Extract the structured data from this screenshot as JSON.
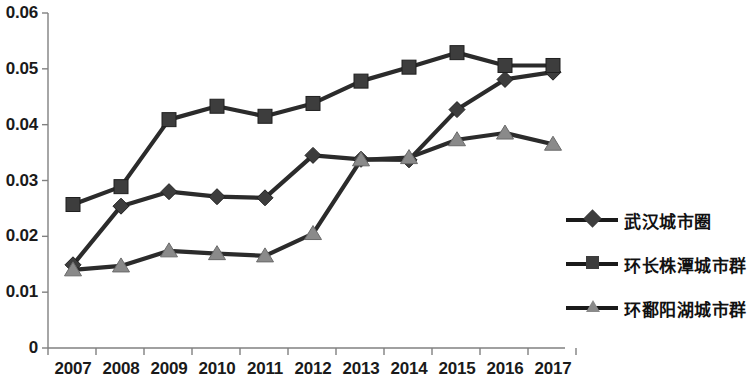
{
  "chart_data": {
    "type": "line",
    "title": "",
    "subtitle": "",
    "xlabel": "",
    "ylabel": "",
    "categories": [
      "2007",
      "2008",
      "2009",
      "2010",
      "2011",
      "2012",
      "2013",
      "2014",
      "2015",
      "2016",
      "2017"
    ],
    "ylim": [
      0,
      0.06
    ],
    "y_ticks": [
      "0",
      "0.01",
      "0.02",
      "0.03",
      "0.04",
      "0.05",
      "0.06"
    ],
    "y_tick_values": [
      0,
      0.01,
      0.02,
      0.03,
      0.04,
      0.05,
      0.06
    ],
    "grid": false,
    "legend_position": "right",
    "series": [
      {
        "name": "武汉城市圈",
        "marker": "diamond",
        "color": "#2b2b2b",
        "marker_color": "#3d3d3d",
        "values": [
          0.0149,
          0.0254,
          0.028,
          0.0271,
          0.0269,
          0.0345,
          0.0338,
          0.0337,
          0.0427,
          0.0481,
          0.0494
        ]
      },
      {
        "name": "环长株潭城市群",
        "marker": "square",
        "color": "#2b2b2b",
        "marker_color": "#3d3d3d",
        "values": [
          0.0257,
          0.0289,
          0.0409,
          0.0433,
          0.0415,
          0.0438,
          0.0478,
          0.0503,
          0.0529,
          0.0506,
          0.0506
        ]
      },
      {
        "name": "环鄱阳湖城市群",
        "marker": "triangle",
        "color": "#2b2b2b",
        "marker_color": "#8a8a8a",
        "values": [
          0.014,
          0.0147,
          0.0174,
          0.0169,
          0.0165,
          0.0205,
          0.0337,
          0.0341,
          0.0373,
          0.0385,
          0.0365
        ]
      }
    ],
    "axis_color": "#808080",
    "background": "#ffffff"
  },
  "legend": {
    "items": [
      {
        "label": "武汉城市圈",
        "marker": "diamond-marker"
      },
      {
        "label": "环长株潭城市群",
        "marker": "square-marker"
      },
      {
        "label": "环鄱阳湖城市群",
        "marker": "triangle-marker"
      }
    ]
  }
}
